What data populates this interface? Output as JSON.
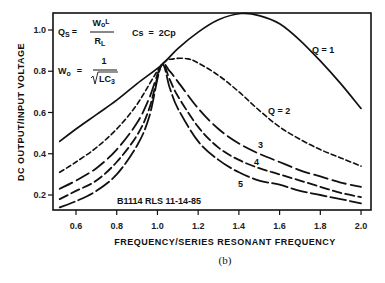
{
  "chart_data": {
    "type": "line",
    "title": "",
    "xlabel": "FREQUENCY/SERIES RESONANT FREQUENCY",
    "ylabel": "DC OUTPUT/INPUT VOLTAGE",
    "xlim": [
      0.49,
      2.05
    ],
    "ylim": [
      0.13,
      1.08
    ],
    "x_ticks": [
      0.6,
      0.8,
      1.0,
      1.2,
      1.4,
      1.6,
      1.8,
      2.0
    ],
    "x_tick_labels": [
      "0.6",
      "0.8",
      "1.0",
      "1.2",
      "1.4",
      "1.6",
      "1.8",
      "2.0"
    ],
    "y_ticks": [
      0.2,
      0.4,
      0.6,
      0.8,
      1.0
    ],
    "y_tick_labels": [
      "0.2",
      "0.4",
      "0.6",
      "0.8",
      "1.0"
    ],
    "grid": false,
    "legend": "inline labels",
    "series": [
      {
        "name": "Q = 1",
        "label": "Q = 1",
        "style": "solid",
        "x": [
          0.52,
          0.6,
          0.7,
          0.8,
          0.9,
          1.02,
          1.1,
          1.2,
          1.3,
          1.41,
          1.5,
          1.6,
          1.7,
          1.8,
          1.9,
          2.0
        ],
        "y": [
          0.46,
          0.52,
          0.59,
          0.66,
          0.74,
          0.83,
          0.91,
          0.99,
          1.05,
          1.08,
          1.07,
          1.03,
          0.95,
          0.85,
          0.74,
          0.62
        ]
      },
      {
        "name": "Q = 2",
        "label": "Q = 2",
        "style": "short-dash",
        "x": [
          0.52,
          0.6,
          0.7,
          0.8,
          0.9,
          1.02,
          1.08,
          1.15,
          1.2,
          1.3,
          1.4,
          1.5,
          1.6,
          1.7,
          1.8,
          1.9,
          2.0
        ],
        "y": [
          0.31,
          0.36,
          0.43,
          0.52,
          0.64,
          0.83,
          0.86,
          0.86,
          0.84,
          0.78,
          0.7,
          0.61,
          0.53,
          0.47,
          0.42,
          0.38,
          0.34
        ]
      },
      {
        "name": "Q = 3",
        "label": "3",
        "style": "long-dash",
        "x": [
          0.52,
          0.6,
          0.7,
          0.8,
          0.9,
          0.96,
          1.02,
          1.06,
          1.1,
          1.2,
          1.3,
          1.4,
          1.5,
          1.6,
          1.7,
          1.8,
          1.9,
          2.0
        ],
        "y": [
          0.23,
          0.27,
          0.33,
          0.42,
          0.55,
          0.67,
          0.83,
          0.8,
          0.75,
          0.62,
          0.52,
          0.45,
          0.4,
          0.36,
          0.32,
          0.29,
          0.26,
          0.24
        ]
      },
      {
        "name": "Q = 4",
        "label": "4",
        "style": "long-dash",
        "x": [
          0.52,
          0.6,
          0.7,
          0.8,
          0.9,
          0.96,
          1.02,
          1.06,
          1.1,
          1.2,
          1.3,
          1.4,
          1.5,
          1.6,
          1.7,
          1.8,
          1.9,
          2.0
        ],
        "y": [
          0.18,
          0.22,
          0.27,
          0.36,
          0.49,
          0.62,
          0.83,
          0.76,
          0.68,
          0.53,
          0.43,
          0.37,
          0.33,
          0.3,
          0.27,
          0.24,
          0.21,
          0.19
        ]
      },
      {
        "name": "Q = 5",
        "label": "5",
        "style": "long-dash",
        "x": [
          0.52,
          0.6,
          0.7,
          0.8,
          0.9,
          0.96,
          1.02,
          1.06,
          1.1,
          1.2,
          1.3,
          1.4,
          1.5,
          1.6,
          1.7,
          1.8,
          1.9,
          2.0
        ],
        "y": [
          0.14,
          0.17,
          0.22,
          0.3,
          0.44,
          0.58,
          0.83,
          0.72,
          0.62,
          0.46,
          0.37,
          0.31,
          0.27,
          0.25,
          0.22,
          0.2,
          0.18,
          0.16
        ]
      }
    ],
    "annotations": [
      {
        "text": "Qs = WoL / RL",
        "x": 0.55,
        "y": 1.0
      },
      {
        "text": "Cs = 2Cp",
        "x": 0.95,
        "y": 1.0
      },
      {
        "text": "Wo = 1 / √LC3",
        "x": 0.55,
        "y": 0.8
      },
      {
        "text": "B1114 RLS 11-14-85",
        "x": 0.95,
        "y": 0.19
      }
    ]
  },
  "labels": {
    "y_axis_title": "DC OUTPUT/INPUT VOLTAGE",
    "x_axis_title": "FREQUENCY/SERIES RESONANT FREQUENCY",
    "caption": "(b)",
    "formula_qs_lhs": "Q",
    "formula_qs_sub": "S",
    "formula_eq": "=",
    "formula_qs_num": "W",
    "formula_qs_num_sub": "o",
    "formula_qs_num_rest": "L",
    "formula_qs_den": "R",
    "formula_qs_den_sub": "L",
    "formula_cs": "Cs  =  2Cp",
    "formula_wo_lhs": "W",
    "formula_wo_sub": "o",
    "formula_wo_num": "1",
    "formula_wo_den": "LC",
    "formula_wo_den_sub": "3",
    "drawing_id": "B1114 RLS 11-14-85",
    "curve_label_q1": "Q = 1",
    "curve_label_q2": "Q = 2",
    "curve_label_q3": "3",
    "curve_label_q4": "4",
    "curve_label_q5": "5"
  },
  "colors": {
    "ink": "#111111",
    "background": "#ffffff"
  }
}
